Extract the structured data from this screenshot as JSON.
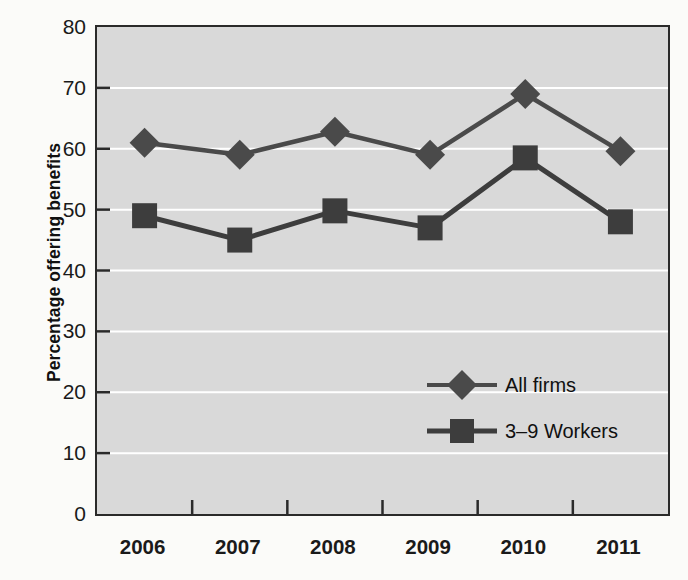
{
  "chart_data": {
    "type": "line",
    "title": "",
    "xlabel": "",
    "ylabel": "Percentage offering benefits",
    "categories": [
      "2006",
      "2007",
      "2008",
      "2009",
      "2010",
      "2011"
    ],
    "ylim": [
      0,
      80
    ],
    "ytick_step": 10,
    "yticks": [
      "0",
      "10",
      "20",
      "30",
      "40",
      "50",
      "60",
      "70",
      "80"
    ],
    "grid": "horizontal-white",
    "legend_position": "inside-lower-right",
    "series": [
      {
        "name": "All firms",
        "marker": "diamond",
        "color": "#4a4a4a",
        "values": [
          61,
          59,
          62.8,
          59,
          69,
          59.6
        ]
      },
      {
        "name": "3–9 Workers",
        "marker": "square",
        "color": "#3d3d3d",
        "values": [
          49,
          45,
          49.8,
          47,
          58.5,
          48
        ]
      }
    ]
  },
  "colors": {
    "panel_background": "#d9d9d9",
    "page_background": "#fbfbf9",
    "gridline": "#ffffff",
    "axis": "#2a2a2a",
    "series_all_firms": "#4a4a4a",
    "series_small_firms": "#3d3d3d"
  }
}
